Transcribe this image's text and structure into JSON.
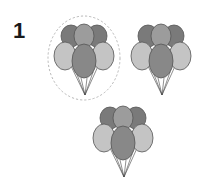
{
  "question_number": "1",
  "colors": {
    "dark": "#7a7a7a",
    "medium": "#9c9c9c",
    "light": "#c4c4c4",
    "center": "#888888",
    "outline": "#555555",
    "string": "#444444",
    "dashed_circle": "#b0b0b0"
  },
  "clusters": [
    {
      "id": "cluster-1",
      "selected": true,
      "cx": 84,
      "cy": 58
    },
    {
      "id": "cluster-2",
      "selected": false,
      "cx": 161,
      "cy": 58
    },
    {
      "id": "cluster-3",
      "selected": false,
      "cx": 123,
      "cy": 140
    }
  ]
}
